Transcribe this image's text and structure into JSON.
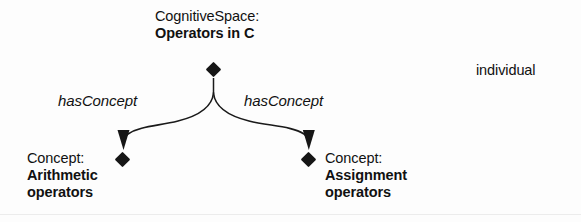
{
  "diagram": {
    "title_node": {
      "type_label": "CognitiveSpace:",
      "name_label": "Operators in C",
      "marker_icon": "diamond-icon"
    },
    "children": [
      {
        "type_label": "Concept:",
        "name_line1": "Arithmetic",
        "name_line2": "operators",
        "marker_icon": "diamond-icon",
        "arrow_icon": "arrowhead-down-icon"
      },
      {
        "type_label": "Concept:",
        "name_line1": "Assignment",
        "name_line2": "operators",
        "marker_icon": "diamond-icon",
        "arrow_icon": "arrowhead-down-icon"
      }
    ],
    "edges": [
      {
        "label": "hasConcept"
      },
      {
        "label": "hasConcept"
      }
    ],
    "legend": {
      "marker_icon": "diamond-icon",
      "label": "individual"
    },
    "colors": {
      "ink": "#161616",
      "background": "#fdfdfd",
      "edge_stroke": "#1a1a1a"
    }
  }
}
